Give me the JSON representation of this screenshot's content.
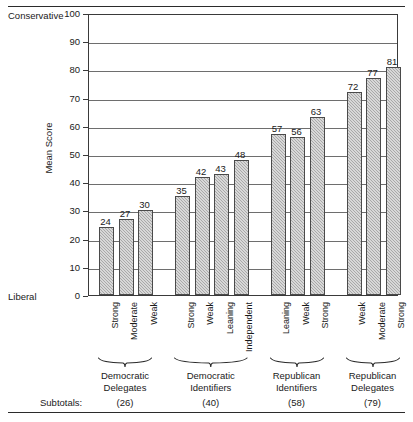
{
  "chart_data": {
    "type": "bar",
    "title": "",
    "xlabel": "",
    "ylabel": "Mean Score",
    "ylim": [
      0,
      100
    ],
    "ytick_labels": [
      "0",
      "10",
      "20",
      "30",
      "40",
      "50",
      "60",
      "70",
      "80",
      "90",
      "100"
    ],
    "ytick_values": [
      0,
      10,
      20,
      30,
      40,
      50,
      60,
      70,
      80,
      90,
      100
    ],
    "grid": true,
    "legend": "none",
    "axis_pole_high": "Conservative",
    "axis_pole_low": "Liberal",
    "categories": [
      "Strong",
      "Moderate",
      "Weak",
      "Strong",
      "Weak",
      "Leaning",
      "Independent",
      "Leaning",
      "Weak",
      "Strong",
      "Weak",
      "Moderate",
      "Strong"
    ],
    "values": [
      24,
      27,
      30,
      35,
      42,
      43,
      48,
      57,
      56,
      63,
      72,
      77,
      81
    ],
    "groups": [
      {
        "label_line1": "Democratic",
        "label_line2": "Delegates",
        "subtotal": "(26)",
        "categories": [
          "Strong",
          "Moderate",
          "Weak"
        ],
        "values": [
          24,
          27,
          30
        ]
      },
      {
        "label_line1": "Democratic",
        "label_line2": "Identifiers",
        "subtotal": "(40)",
        "categories": [
          "Strong",
          "Weak",
          "Leaning",
          "Independent"
        ],
        "values": [
          35,
          42,
          43,
          48
        ]
      },
      {
        "label_line1": "Republican",
        "label_line2": "Identifiers",
        "subtotal": "(58)",
        "categories": [
          "Leaning",
          "Weak",
          "Strong"
        ],
        "values": [
          57,
          56,
          63
        ]
      },
      {
        "label_line1": "Republican",
        "label_line2": "Delegates",
        "subtotal": "(79)",
        "categories": [
          "Weak",
          "Moderate",
          "Strong"
        ],
        "values": [
          72,
          77,
          81
        ]
      }
    ],
    "subtotals_label": "Subtotals:"
  }
}
